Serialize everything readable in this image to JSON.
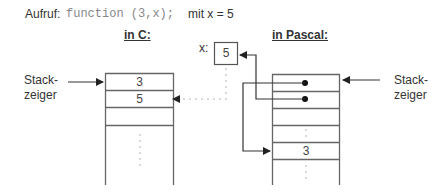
{
  "header": {
    "call_label": "Aufruf:",
    "call_code": "function (3,x);",
    "condition": "mit  x  =  5"
  },
  "c_side": {
    "title": "in C:",
    "stack_pointer_label_line1": "Stack-",
    "stack_pointer_label_line2": "zeiger",
    "cells": [
      "3",
      "5",
      "",
      ""
    ]
  },
  "variable": {
    "name": "x:",
    "value": "5"
  },
  "pascal_side": {
    "title": "in Pascal:",
    "stack_pointer_label_line1": "Stack-",
    "stack_pointer_label_line2": "zeiger",
    "cells": [
      "•",
      "•",
      "",
      "",
      "3"
    ]
  },
  "colors": {
    "line": "#555555",
    "text": "#333333",
    "code": "#888888",
    "dots": "#999999"
  }
}
